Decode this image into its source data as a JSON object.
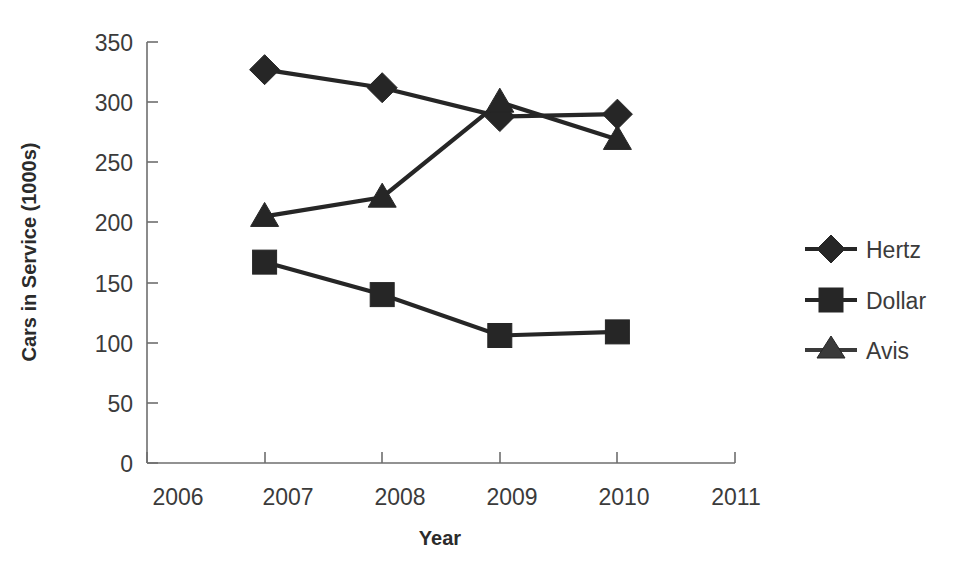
{
  "chart_data": {
    "type": "line",
    "title": "",
    "xlabel": "Year",
    "ylabel": "Cars in Service (1000s)",
    "x": [
      2007,
      2008,
      2009,
      2010
    ],
    "xlim": [
      2006,
      2011
    ],
    "ylim": [
      0,
      350
    ],
    "x_ticks": [
      "2006",
      "2007",
      "2008",
      "2009",
      "2010",
      "2011"
    ],
    "y_ticks": [
      "0",
      "50",
      "100",
      "150",
      "200",
      "250",
      "300",
      "350"
    ],
    "grid": false,
    "legend_position": "right",
    "series": [
      {
        "name": "Hertz",
        "marker": "diamond",
        "color": "#262626",
        "values": [
          327,
          312,
          288,
          290
        ]
      },
      {
        "name": "Dollar",
        "marker": "square",
        "color": "#262626",
        "values": [
          167,
          140,
          106,
          109
        ]
      },
      {
        "name": "Avis",
        "marker": "triangle",
        "color": "#3a3a3a",
        "values": [
          205,
          221,
          300,
          269
        ]
      }
    ]
  },
  "axes": {
    "y_title": "Cars in Service (1000s)",
    "x_title": "Year",
    "y_tick_labels": [
      "350",
      "300",
      "250",
      "200",
      "150",
      "100",
      "50",
      "0"
    ],
    "x_tick_labels": [
      "2006",
      "2007",
      "2008",
      "2009",
      "2010",
      "2011"
    ]
  },
  "legend": {
    "items": [
      {
        "label": "Hertz",
        "marker": "diamond-marker-icon"
      },
      {
        "label": "Dollar",
        "marker": "square-marker-icon"
      },
      {
        "label": "Avis",
        "marker": "triangle-marker-icon"
      }
    ]
  }
}
